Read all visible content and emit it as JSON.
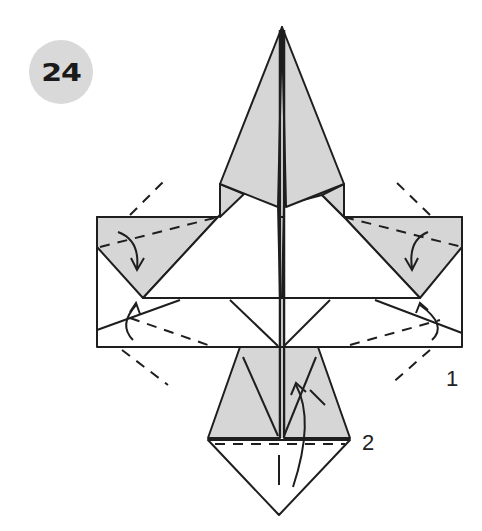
{
  "step": {
    "number": "24"
  },
  "labels": {
    "one": "1",
    "two": "2"
  },
  "colors": {
    "shade": "#d6d6d6",
    "line": "#1e1e1e",
    "badge": "#d9d9d9",
    "paper": "#ffffff"
  }
}
